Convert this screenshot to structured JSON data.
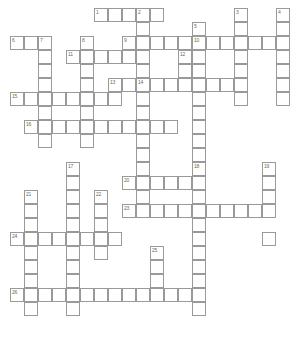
{
  "puzzle": {
    "type": "crossword-grid",
    "title": "Crossword puzzle grid",
    "cell_size": 14,
    "origin_x": 10,
    "origin_y": 8,
    "colors": {
      "cell_fill": "#ffffff",
      "cell_border": "#9a9a9a",
      "number_text": "#6a6a6a",
      "background": "#ffffff"
    },
    "columns": 20,
    "rows": 24,
    "clue_count": 26,
    "entries": [
      {
        "number": "1",
        "direction": "across",
        "col": 6,
        "row": 0,
        "length": 5
      },
      {
        "number": "2",
        "direction": "down",
        "col": 9,
        "row": 0,
        "length": 5
      },
      {
        "number": "3",
        "direction": "down",
        "col": 16,
        "row": 0,
        "length": 7
      },
      {
        "number": "4",
        "direction": "down",
        "col": 19,
        "row": 0,
        "length": 7
      },
      {
        "number": "5",
        "direction": "down",
        "col": 13,
        "row": 1,
        "length": 9
      },
      {
        "number": "6",
        "direction": "across",
        "col": 0,
        "row": 2,
        "length": 3
      },
      {
        "number": "7",
        "direction": "down",
        "col": 2,
        "row": 2,
        "length": 8
      },
      {
        "number": "8",
        "direction": "down",
        "col": 5,
        "row": 2,
        "length": 7
      },
      {
        "number": "9",
        "direction": "across",
        "col": 8,
        "row": 2,
        "length": 5
      },
      {
        "number": "10",
        "direction": "across",
        "col": 13,
        "row": 2,
        "length": 7
      },
      {
        "number": "11",
        "direction": "across",
        "col": 4,
        "row": 3,
        "length": 6
      },
      {
        "number": "12",
        "direction": "down",
        "col": 12,
        "row": 3,
        "length": 3
      },
      {
        "number": "13",
        "direction": "across",
        "col": 7,
        "row": 4,
        "length": 10
      },
      {
        "number": "14",
        "direction": "down",
        "col": 9,
        "row": 4,
        "length": 4
      },
      {
        "number": "15",
        "direction": "across",
        "col": 0,
        "row": 6,
        "length": 8
      },
      {
        "number": "16",
        "direction": "across",
        "col": 1,
        "row": 8,
        "length": 11
      },
      {
        "number": "17",
        "direction": "down",
        "col": 4,
        "row": 11,
        "length": 9
      },
      {
        "number": "18",
        "direction": "down",
        "col": 13,
        "row": 11,
        "length": 4
      },
      {
        "number": "19",
        "direction": "down",
        "col": 18,
        "row": 11,
        "length": 4
      },
      {
        "number": "20",
        "direction": "across",
        "col": 8,
        "row": 12,
        "length": 5
      },
      {
        "number": "21",
        "direction": "down",
        "col": 1,
        "row": 13,
        "length": 8
      },
      {
        "number": "22",
        "direction": "down",
        "col": 6,
        "row": 13,
        "length": 6
      },
      {
        "number": "23",
        "direction": "across",
        "col": 8,
        "row": 14,
        "length": 11
      },
      {
        "number": "24",
        "direction": "across",
        "col": 0,
        "row": 16,
        "length": 8
      },
      {
        "number": "25",
        "direction": "down",
        "col": 10,
        "row": 17,
        "length": 4
      },
      {
        "number": "26",
        "direction": "across",
        "col": 0,
        "row": 20,
        "length": 13
      }
    ],
    "cells": [
      {
        "c": 6,
        "r": 0,
        "n": "1"
      },
      {
        "c": 7,
        "r": 0
      },
      {
        "c": 8,
        "r": 0
      },
      {
        "c": 9,
        "r": 0,
        "n": "2"
      },
      {
        "c": 10,
        "r": 0
      },
      {
        "c": 16,
        "r": 0,
        "n": "3"
      },
      {
        "c": 19,
        "r": 0,
        "n": "4"
      },
      {
        "c": 9,
        "r": 1
      },
      {
        "c": 13,
        "r": 1,
        "n": "5"
      },
      {
        "c": 16,
        "r": 1
      },
      {
        "c": 19,
        "r": 1
      },
      {
        "c": 0,
        "r": 2,
        "n": "6"
      },
      {
        "c": 1,
        "r": 2
      },
      {
        "c": 2,
        "r": 2,
        "n": "7"
      },
      {
        "c": 5,
        "r": 2,
        "n": "8"
      },
      {
        "c": 8,
        "r": 2,
        "n": "9"
      },
      {
        "c": 9,
        "r": 2
      },
      {
        "c": 10,
        "r": 2
      },
      {
        "c": 11,
        "r": 2
      },
      {
        "c": 12,
        "r": 2
      },
      {
        "c": 13,
        "r": 2,
        "n": "10"
      },
      {
        "c": 14,
        "r": 2
      },
      {
        "c": 15,
        "r": 2
      },
      {
        "c": 16,
        "r": 2
      },
      {
        "c": 17,
        "r": 2
      },
      {
        "c": 18,
        "r": 2
      },
      {
        "c": 19,
        "r": 2
      },
      {
        "c": 2,
        "r": 3
      },
      {
        "c": 4,
        "r": 3,
        "n": "11"
      },
      {
        "c": 5,
        "r": 3
      },
      {
        "c": 6,
        "r": 3
      },
      {
        "c": 7,
        "r": 3
      },
      {
        "c": 8,
        "r": 3
      },
      {
        "c": 9,
        "r": 3
      },
      {
        "c": 12,
        "r": 3,
        "n": "12"
      },
      {
        "c": 13,
        "r": 3
      },
      {
        "c": 16,
        "r": 3
      },
      {
        "c": 19,
        "r": 3
      },
      {
        "c": 2,
        "r": 4
      },
      {
        "c": 5,
        "r": 4
      },
      {
        "c": 9,
        "r": 4
      },
      {
        "c": 12,
        "r": 4
      },
      {
        "c": 13,
        "r": 4
      },
      {
        "c": 16,
        "r": 4
      },
      {
        "c": 19,
        "r": 4
      },
      {
        "c": 2,
        "r": 5
      },
      {
        "c": 5,
        "r": 5
      },
      {
        "c": 7,
        "r": 5,
        "n": "13"
      },
      {
        "c": 8,
        "r": 5
      },
      {
        "c": 9,
        "r": 5,
        "n": "14"
      },
      {
        "c": 10,
        "r": 5
      },
      {
        "c": 11,
        "r": 5
      },
      {
        "c": 12,
        "r": 5
      },
      {
        "c": 13,
        "r": 5
      },
      {
        "c": 14,
        "r": 5
      },
      {
        "c": 15,
        "r": 5
      },
      {
        "c": 16,
        "r": 5
      },
      {
        "c": 19,
        "r": 5
      },
      {
        "c": 0,
        "r": 6,
        "n": "15"
      },
      {
        "c": 1,
        "r": 6
      },
      {
        "c": 2,
        "r": 6
      },
      {
        "c": 3,
        "r": 6
      },
      {
        "c": 4,
        "r": 6
      },
      {
        "c": 5,
        "r": 6
      },
      {
        "c": 6,
        "r": 6
      },
      {
        "c": 7,
        "r": 6
      },
      {
        "c": 9,
        "r": 6
      },
      {
        "c": 13,
        "r": 6
      },
      {
        "c": 16,
        "r": 6
      },
      {
        "c": 19,
        "r": 6
      },
      {
        "c": 2,
        "r": 7
      },
      {
        "c": 5,
        "r": 7
      },
      {
        "c": 9,
        "r": 7
      },
      {
        "c": 13,
        "r": 7
      },
      {
        "c": 1,
        "r": 8,
        "n": "16"
      },
      {
        "c": 2,
        "r": 8
      },
      {
        "c": 3,
        "r": 8
      },
      {
        "c": 4,
        "r": 8
      },
      {
        "c": 5,
        "r": 8
      },
      {
        "c": 6,
        "r": 8
      },
      {
        "c": 7,
        "r": 8
      },
      {
        "c": 8,
        "r": 8
      },
      {
        "c": 9,
        "r": 8
      },
      {
        "c": 10,
        "r": 8
      },
      {
        "c": 11,
        "r": 8
      },
      {
        "c": 13,
        "r": 8
      },
      {
        "c": 2,
        "r": 9
      },
      {
        "c": 5,
        "r": 9
      },
      {
        "c": 9,
        "r": 9
      },
      {
        "c": 13,
        "r": 9
      },
      {
        "c": 9,
        "r": 10
      },
      {
        "c": 13,
        "r": 10
      },
      {
        "c": 4,
        "r": 11,
        "n": "17"
      },
      {
        "c": 9,
        "r": 11
      },
      {
        "c": 13,
        "r": 11,
        "n": "18"
      },
      {
        "c": 18,
        "r": 11,
        "n": "19"
      },
      {
        "c": 4,
        "r": 12
      },
      {
        "c": 8,
        "r": 12,
        "n": "20"
      },
      {
        "c": 9,
        "r": 12
      },
      {
        "c": 10,
        "r": 12
      },
      {
        "c": 11,
        "r": 12
      },
      {
        "c": 12,
        "r": 12
      },
      {
        "c": 13,
        "r": 12
      },
      {
        "c": 18,
        "r": 12
      },
      {
        "c": 1,
        "r": 13,
        "n": "21"
      },
      {
        "c": 4,
        "r": 13
      },
      {
        "c": 6,
        "r": 13,
        "n": "22"
      },
      {
        "c": 9,
        "r": 13
      },
      {
        "c": 13,
        "r": 13
      },
      {
        "c": 18,
        "r": 13
      },
      {
        "c": 1,
        "r": 14
      },
      {
        "c": 4,
        "r": 14
      },
      {
        "c": 6,
        "r": 14
      },
      {
        "c": 8,
        "r": 14,
        "n": "23"
      },
      {
        "c": 9,
        "r": 14
      },
      {
        "c": 10,
        "r": 14
      },
      {
        "c": 11,
        "r": 14
      },
      {
        "c": 12,
        "r": 14
      },
      {
        "c": 13,
        "r": 14
      },
      {
        "c": 14,
        "r": 14
      },
      {
        "c": 15,
        "r": 14
      },
      {
        "c": 16,
        "r": 14
      },
      {
        "c": 17,
        "r": 14
      },
      {
        "c": 18,
        "r": 14
      },
      {
        "c": 1,
        "r": 15
      },
      {
        "c": 4,
        "r": 15
      },
      {
        "c": 6,
        "r": 15
      },
      {
        "c": 13,
        "r": 15
      },
      {
        "c": 0,
        "r": 16,
        "n": "24"
      },
      {
        "c": 1,
        "r": 16
      },
      {
        "c": 2,
        "r": 16
      },
      {
        "c": 3,
        "r": 16
      },
      {
        "c": 4,
        "r": 16
      },
      {
        "c": 5,
        "r": 16
      },
      {
        "c": 6,
        "r": 16
      },
      {
        "c": 7,
        "r": 16
      },
      {
        "c": 13,
        "r": 16
      },
      {
        "c": 18,
        "r": 16
      },
      {
        "c": 1,
        "r": 17
      },
      {
        "c": 4,
        "r": 17
      },
      {
        "c": 6,
        "r": 17
      },
      {
        "c": 10,
        "r": 17,
        "n": "25"
      },
      {
        "c": 13,
        "r": 17
      },
      {
        "c": 1,
        "r": 18
      },
      {
        "c": 4,
        "r": 18
      },
      {
        "c": 10,
        "r": 18
      },
      {
        "c": 13,
        "r": 18
      },
      {
        "c": 1,
        "r": 19
      },
      {
        "c": 4,
        "r": 19
      },
      {
        "c": 10,
        "r": 19
      },
      {
        "c": 13,
        "r": 19
      },
      {
        "c": 0,
        "r": 20,
        "n": "26"
      },
      {
        "c": 1,
        "r": 20
      },
      {
        "c": 2,
        "r": 20
      },
      {
        "c": 3,
        "r": 20
      },
      {
        "c": 4,
        "r": 20
      },
      {
        "c": 5,
        "r": 20
      },
      {
        "c": 6,
        "r": 20
      },
      {
        "c": 7,
        "r": 20
      },
      {
        "c": 8,
        "r": 20
      },
      {
        "c": 9,
        "r": 20
      },
      {
        "c": 10,
        "r": 20
      },
      {
        "c": 11,
        "r": 20
      },
      {
        "c": 12,
        "r": 20
      },
      {
        "c": 13,
        "r": 20
      },
      {
        "c": 1,
        "r": 21
      },
      {
        "c": 4,
        "r": 21
      },
      {
        "c": 13,
        "r": 21
      }
    ]
  }
}
